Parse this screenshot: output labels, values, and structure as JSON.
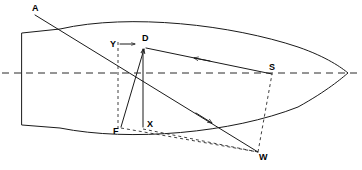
{
  "diagram": {
    "canvas": {
      "width": 362,
      "height": 170,
      "background": "#ffffff"
    },
    "colors": {
      "hull_stroke": "#1a1a1a",
      "vector_stroke": "#1a1a1a",
      "dashed_stroke": "#2a2a2a",
      "label_text": "#000000",
      "background": "#ffffff"
    },
    "labels": {
      "a": "A",
      "y": "Y",
      "d": "D",
      "s": "S",
      "f": "F",
      "x": "X",
      "w": "W"
    },
    "label_positions": {
      "a": {
        "x": 32,
        "y": 11
      },
      "y": {
        "x": 113,
        "y": 45
      },
      "d": {
        "x": 143,
        "y": 40
      },
      "s": {
        "x": 272,
        "y": 69
      },
      "f": {
        "x": 115,
        "y": 131
      },
      "x": {
        "x": 148,
        "y": 126
      },
      "w": {
        "x": 262,
        "y": 157
      }
    },
    "points": {
      "a": {
        "x": 35,
        "y": 15
      },
      "d": {
        "x": 145,
        "y": 48
      },
      "s": {
        "x": 272,
        "y": 74
      },
      "f": {
        "x": 121,
        "y": 127
      },
      "x_base": {
        "x": 143,
        "y": 127
      },
      "w": {
        "x": 258,
        "y": 152
      },
      "bow": {
        "x": 348,
        "y": 73
      },
      "transom_top": {
        "x": 22,
        "y": 33
      },
      "transom_bottom": {
        "x": 22,
        "y": 125
      }
    },
    "geometry": {
      "hull_path": "M 22 33 L 60 29 C 130 14 230 26 296 48 C 326 58 342 68 348 73 C 342 78 326 92 296 108 C 230 134 130 142 60 128 L 22 125 Z",
      "centerline_y": 73,
      "centerline_x_start": 2,
      "centerline_x_end": 360
    },
    "vectors": [
      {
        "name": "A-to-W",
        "from": "a",
        "to": "w",
        "arrow": "mid-toward-d"
      },
      {
        "name": "S-to-D",
        "from": "s",
        "to": "d",
        "arrow": "toward-d"
      },
      {
        "name": "F-to-D",
        "from": "f",
        "to": "d",
        "arrow": "up"
      },
      {
        "name": "X-vertical",
        "from": "x_base",
        "to": "d",
        "arrow": "up"
      },
      {
        "name": "Y-to-D",
        "from": "y",
        "to": "d",
        "arrow": "right"
      },
      {
        "name": "D-to-W",
        "from": "d",
        "to": "w",
        "arrow": "toward-d"
      }
    ],
    "construction_lines": [
      {
        "name": "vertical-dashed-through-Y",
        "from_x": 118,
        "from_y": 44,
        "to_x": 118,
        "to_y": 129
      },
      {
        "name": "dashed-F-to-W",
        "from_x": 121,
        "from_y": 128,
        "to_x": 258,
        "to_y": 152
      },
      {
        "name": "dashed-W-to-S",
        "from_x": 258,
        "from_y": 152,
        "to_x": 272,
        "to_y": 74
      },
      {
        "name": "dashed-X-base-to-W",
        "from_x": 143,
        "from_y": 128,
        "to_x": 258,
        "to_y": 152
      }
    ]
  }
}
